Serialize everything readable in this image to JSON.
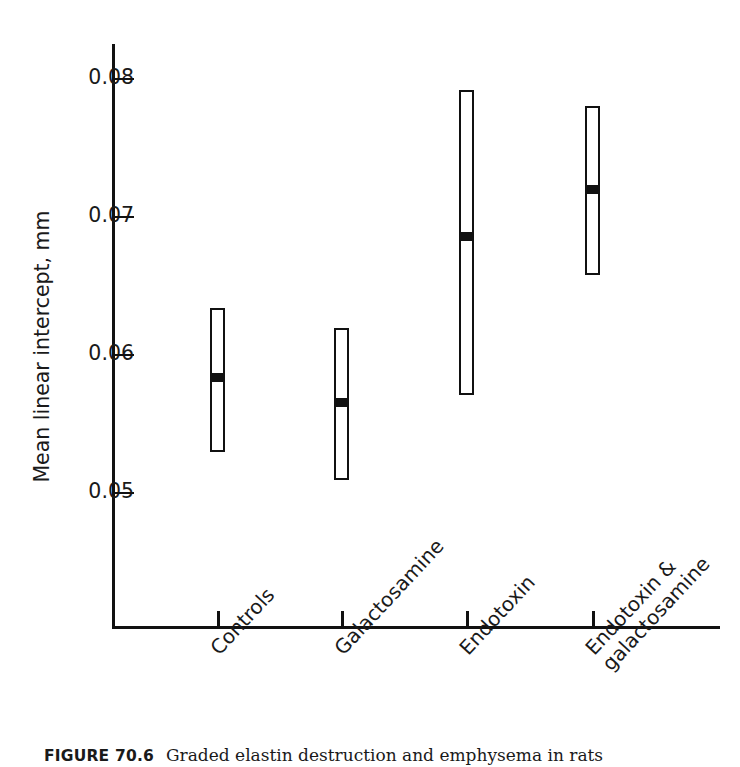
{
  "figure": {
    "caption_label": "FIGURE 70.6",
    "caption_text": "Graded elastin destruction and emphysema in rats"
  },
  "chart_data": {
    "type": "scatter",
    "title": "",
    "xlabel": "",
    "ylabel": "Mean linear intercept, mm",
    "ylim": [
      0.0455,
      0.0849
    ],
    "yticks": [
      0.05,
      0.06,
      0.07,
      0.08
    ],
    "ytick_labels": [
      "0.05",
      "0.06",
      "0.07",
      "0.08"
    ],
    "grid": false,
    "legend": "none",
    "categories": [
      "Controls",
      "Galactosamine",
      "Endotoxin",
      "Endotoxin & galactosamine"
    ],
    "series": [
      {
        "name": "Mean linear intercept",
        "mean": [
          0.0583,
          0.0565,
          0.0685,
          0.0719
        ],
        "range_low": [
          0.0529,
          0.0509,
          0.057,
          0.0657
        ],
        "range_high": [
          0.0633,
          0.0619,
          0.0791,
          0.078
        ]
      }
    ],
    "points": [
      {
        "category": "Controls",
        "mean": 0.0583,
        "low": 0.0529,
        "high": 0.0633
      },
      {
        "category": "Galactosamine",
        "mean": 0.0565,
        "low": 0.0509,
        "high": 0.0619
      },
      {
        "category": "Endotoxin",
        "mean": 0.0685,
        "low": 0.057,
        "high": 0.0791
      },
      {
        "category": "Endotoxin & galactosamine",
        "mean": 0.0719,
        "low": 0.0657,
        "high": 0.078
      }
    ],
    "mark_style": {
      "range": "open vertical box",
      "center": "filled black square",
      "color": "#111111"
    }
  },
  "axis": {
    "y_title": "Mean linear intercept, mm",
    "ticks": [
      {
        "label": "0.08",
        "value": 0.08
      },
      {
        "label": "0.07",
        "value": 0.07
      },
      {
        "label": "0.06",
        "value": 0.06
      },
      {
        "label": "0.05",
        "value": 0.05
      }
    ]
  },
  "x_labels": [
    {
      "line1": "Controls",
      "line2": ""
    },
    {
      "line1": "Galactosamine",
      "line2": ""
    },
    {
      "line1": "Endotoxin",
      "line2": ""
    },
    {
      "line1": "Endotoxin &",
      "line2": "galactosamine"
    }
  ]
}
